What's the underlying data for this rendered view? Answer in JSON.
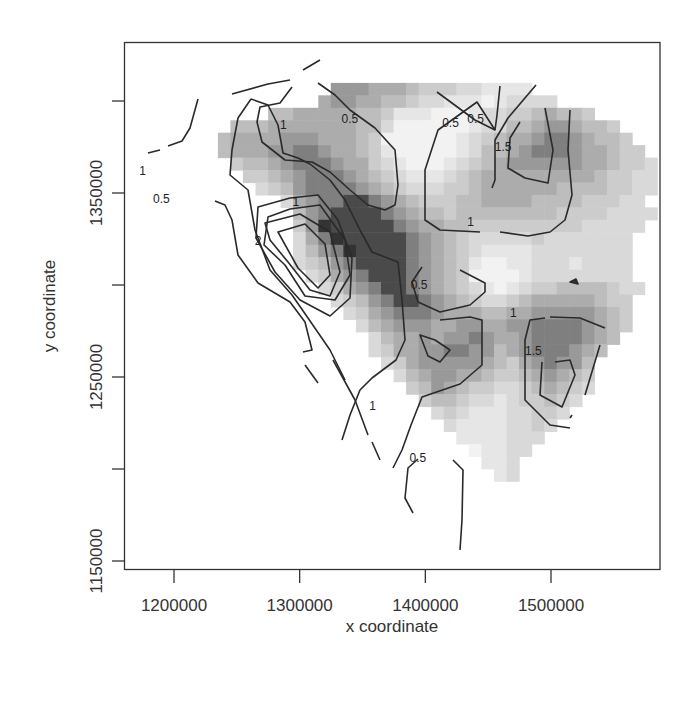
{
  "chart_data": {
    "type": "heatmap",
    "subtype": "levelplot with contour lines",
    "title": "",
    "xlabel": "x coordinate",
    "ylabel": "y coordinate",
    "xlim": [
      1160000,
      1590000
    ],
    "ylim": [
      1145000,
      1392000
    ],
    "x_ticks": [
      {
        "value": 1200000,
        "label": "1200000"
      },
      {
        "value": 1300000,
        "label": "1300000"
      },
      {
        "value": 1400000,
        "label": "1400000"
      },
      {
        "value": 1500000,
        "label": "1500000"
      }
    ],
    "y_ticks": [
      {
        "value": 1150000,
        "label": "1150000"
      },
      {
        "value": 1200000,
        "label": ""
      },
      {
        "value": 1250000,
        "label": "1250000"
      },
      {
        "value": 1300000,
        "label": ""
      },
      {
        "value": 1350000,
        "label": "1350000"
      },
      {
        "value": 1400000,
        "label": ""
      }
    ],
    "contour_levels": [
      0.5,
      1,
      1.5,
      2
    ],
    "contour_labels": [
      {
        "text": "1",
        "x": 1287000,
        "y": 1387000
      },
      {
        "text": "0.5",
        "x": 1340000,
        "y": 1390000
      },
      {
        "text": "0.5",
        "x": 1420000,
        "y": 1388000
      },
      {
        "text": "0.5",
        "x": 1440000,
        "y": 1390000
      },
      {
        "text": "1",
        "x": 1175000,
        "y": 1362000
      },
      {
        "text": "1",
        "x": 1297000,
        "y": 1345000
      },
      {
        "text": "0.5",
        "x": 1190000,
        "y": 1347000
      },
      {
        "text": "2",
        "x": 1267000,
        "y": 1324000
      },
      {
        "text": "1.5",
        "x": 1462000,
        "y": 1375000
      },
      {
        "text": "1",
        "x": 1436000,
        "y": 1334000
      },
      {
        "text": "0.5",
        "x": 1395000,
        "y": 1300000
      },
      {
        "text": "1",
        "x": 1470000,
        "y": 1285000
      },
      {
        "text": "1.5",
        "x": 1486000,
        "y": 1264000
      },
      {
        "text": "1",
        "x": 1358000,
        "y": 1234000
      },
      {
        "text": "0.5",
        "x": 1394000,
        "y": 1206000
      }
    ],
    "peaks": [
      {
        "x": 1305000,
        "y": 1320000,
        "value": 2.6,
        "note": "global maximum (darkest)"
      },
      {
        "x": 1463000,
        "y": 1368000,
        "value": 1.6
      },
      {
        "x": 1483000,
        "y": 1254000,
        "value": 1.6
      },
      {
        "x": 1387000,
        "y": 1264000,
        "value": 1.4
      }
    ],
    "lows": [
      {
        "x": 1345000,
        "y": 1375000,
        "value": 0.3
      },
      {
        "x": 1398000,
        "y": 1296000,
        "value": 0.3
      }
    ],
    "colorscale": "grayscale (white = low, black = high)",
    "grid": false,
    "legend": "none"
  },
  "grid": {
    "x0": 130,
    "y0": 58,
    "cell_w": 12.55,
    "cell_h": 12.45,
    "rows": [
      "000000000000000000000000000000000000000000",
      "000000000000000000000000000000000000000000",
      "0000000000000000777666544433222200000000000",
      "0000000000000006776655433222123333000000000",
      "0000000000055666665542221112334456554000000",
      "0000000055566666665531111112335567765540000",
      "0000000566667776665411111123456678876554000",
      "0000000566677887665421111123556788876654400",
      "0000000045567888766432111234567777776654430",
      "0000000004456788876543222345666666666544330",
      "0000000000345788887654333445666666555544330",
      "0000000000003678899876544455666655554443300",
      "0000000000000578999987655455555555444433330",
      "0000000000000479999998766554444444443333300",
      "0000000000000368999999876543333343333333000",
      "0000000000000357899999876543222233333333000",
      "0000000000000345789999876542112233323333000",
      "0000000000000034678999876541111233333333000",
      "0000000000000003467899876543212344555543300",
      "0000000000000000345789987654334566666544000",
      "0000000000000000034678887666556677777654000",
      "0000000000000000003567776677667788887654000",
      "0000000000000000000356676778766788887650000",
      "0000000000000000000346677887756788876500000",
      "0000000000000000000034677777654678775000000",
      "0000000000000000000003567766544567654000000",
      "0000000000000000000000457654433456543000000",
      "0000000000000000000000045543323445430000000",
      "0000000000000000000000003432223344300000000",
      "0000000000000000000000000322223343000000000",
      "0000000000000000000000000022223330000000000",
      "0000000000000000000000000001223300000000000",
      "0000000000000000000000000000223000000000000",
      "0000000000000000000000000000023000000000000",
      "0000000000000000000000000000000000000000000"
    ]
  }
}
